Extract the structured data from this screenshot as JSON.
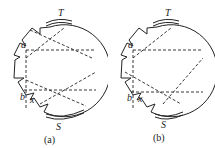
{
  "panels": [
    {
      "id": "a",
      "caption": "(a)",
      "labels": {
        "top": "T",
        "bottom": "S",
        "point_a": "a",
        "point_b": "b",
        "point_x": "x"
      }
    },
    {
      "id": "b",
      "caption": "(b)",
      "labels": {
        "top": "T",
        "bottom": "S",
        "point_a": "a",
        "point_b": "b",
        "point_x": "x"
      }
    }
  ]
}
